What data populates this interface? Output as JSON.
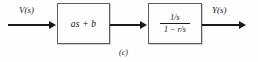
{
  "figure": {
    "caption": "(c)",
    "type": "block-diagram",
    "background_color": "#fefefe",
    "line_color": "#1a1a1a",
    "block_border_color": "#5c5c5c"
  },
  "signals": {
    "input_label": "V(s)",
    "output_label": "Y(s)"
  },
  "blocks": [
    {
      "id": "gain-block",
      "label": "as + b"
    },
    {
      "id": "transfer-block",
      "numerator": "1/s",
      "denominator": "1 − r/s"
    }
  ],
  "connections": [
    {
      "id": "input-arrow",
      "from": "source",
      "to": "gain-block"
    },
    {
      "id": "interstage-arrow",
      "from": "gain-block",
      "to": "transfer-block"
    },
    {
      "id": "output-arrow",
      "from": "transfer-block",
      "to": "sink"
    }
  ]
}
